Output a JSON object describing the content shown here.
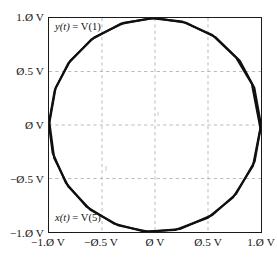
{
  "figure": {
    "kind": "xy-plot",
    "background_color": "#ffffff"
  },
  "axes": {
    "x_ticks": [
      "−1.Ø V",
      "−Ø.5 V",
      "Ø V",
      "Ø.5 V",
      "1.Ø V"
    ],
    "y_ticks": [
      "1.Ø V",
      "Ø.5 V",
      "Ø V",
      "−Ø.5 V",
      "−1.Ø V"
    ],
    "x_tick_values": [
      -1.0,
      -0.5,
      0.0,
      0.5,
      1.0
    ],
    "y_tick_values": [
      1.0,
      0.5,
      0.0,
      -0.5,
      -1.0
    ],
    "frame_color": "#1a1a1a",
    "grid_color": "#b9b9b9",
    "grid_on": true,
    "grid_style": "dashed"
  },
  "annotations": {
    "y_signal": {
      "var": "y",
      "arg": "(t)",
      "eq": " = V(1)"
    },
    "x_signal": {
      "var": "x",
      "arg": "(t)",
      "eq": " = V(5)"
    }
  },
  "chart_data": {
    "type": "line",
    "title": "",
    "xlabel": "",
    "ylabel": "",
    "xlim": [
      -1.0,
      1.0
    ],
    "ylim": [
      -1.0,
      1.0
    ],
    "grid": true,
    "legend": "none",
    "trace_color": "#101010",
    "trace_width": 2.1,
    "series": [
      {
        "name": "y(t) = V(1) vs x(t) = V(5)",
        "closed": true,
        "x": [
          1.0,
          0.937,
          0.8,
          0.574,
          0.292,
          0.0,
          -0.292,
          -0.574,
          -0.8,
          -0.937,
          -1.0,
          -0.966,
          -0.841,
          -0.643,
          -0.383,
          -0.105,
          0.19,
          0.5,
          0.736,
          0.924,
          1.0
        ],
        "y": [
          0.0,
          0.349,
          0.6,
          0.819,
          0.956,
          1.0,
          0.956,
          0.819,
          0.6,
          0.349,
          0.0,
          -0.259,
          -0.541,
          -0.766,
          -0.924,
          -0.995,
          -0.982,
          -0.866,
          -0.677,
          -0.383,
          0.0
        ]
      },
      {
        "name": "second pass (offset)",
        "closed": true,
        "x": [
          0.995,
          0.914,
          0.766,
          0.541,
          0.259,
          -0.035,
          -0.326,
          -0.601,
          -0.819,
          -0.946,
          -0.998,
          -0.951,
          -0.818,
          -0.61,
          -0.342,
          -0.06,
          0.235,
          0.541,
          0.766,
          0.94,
          0.995
        ],
        "y": [
          -0.035,
          0.383,
          0.629,
          0.841,
          0.966,
          0.999,
          0.945,
          0.799,
          0.574,
          0.326,
          0.035,
          -0.309,
          -0.575,
          -0.792,
          -0.94,
          -0.998,
          -0.972,
          -0.841,
          -0.643,
          -0.342,
          -0.035
        ]
      }
    ]
  }
}
